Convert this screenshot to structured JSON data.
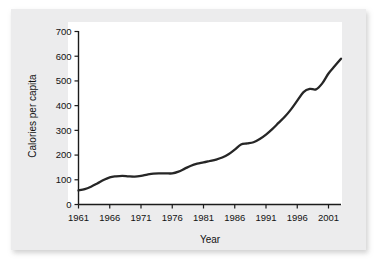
{
  "chart_data": {
    "type": "line",
    "title": "",
    "xlabel": "Year",
    "ylabel": "Calories per capita",
    "xlim": [
      1961,
      2003
    ],
    "ylim": [
      0,
      700
    ],
    "grid": false,
    "legend": null,
    "x_ticks": [
      "1961",
      "1966",
      "1971",
      "1976",
      "1981",
      "1986",
      "1991",
      "1996",
      "2001"
    ],
    "y_ticks": [
      "0",
      "100",
      "200",
      "300",
      "400",
      "500",
      "600",
      "700"
    ],
    "line_color": "#262626",
    "series": [
      {
        "name": "Calories per capita",
        "x": [
          1961,
          1962,
          1963,
          1964,
          1965,
          1966,
          1967,
          1968,
          1969,
          1970,
          1971,
          1972,
          1973,
          1974,
          1975,
          1976,
          1977,
          1978,
          1979,
          1980,
          1981,
          1982,
          1983,
          1984,
          1985,
          1986,
          1987,
          1988,
          1989,
          1990,
          1991,
          1992,
          1993,
          1994,
          1995,
          1996,
          1997,
          1998,
          1999,
          2000,
          2001,
          2002,
          2003
        ],
        "values": [
          57,
          62,
          72,
          85,
          99,
          110,
          114,
          116,
          114,
          113,
          116,
          121,
          125,
          126,
          126,
          126,
          133,
          145,
          157,
          165,
          170,
          176,
          182,
          190,
          203,
          222,
          243,
          247,
          252,
          265,
          283,
          305,
          330,
          355,
          385,
          420,
          455,
          468,
          466,
          490,
          530,
          560,
          590
        ]
      }
    ],
    "final_value": 615
  },
  "axis_labels": {
    "x_title": "Year",
    "y_title": "Calories per capita"
  },
  "colors": {
    "card_background": "#ececed",
    "plot_background": "#ffffff",
    "line": "#262626",
    "axis": "#1b1b1b",
    "text": "#121212"
  }
}
